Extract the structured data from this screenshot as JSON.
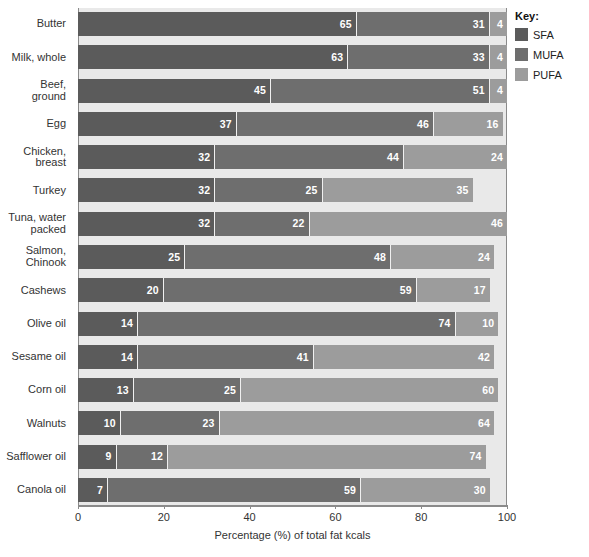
{
  "legend": {
    "title": "Key:",
    "items": [
      {
        "label": "SFA",
        "color": "#5b5b5b"
      },
      {
        "label": "MUFA",
        "color": "#6e6e6e"
      },
      {
        "label": "PUFA",
        "color": "#9c9c9c"
      }
    ]
  },
  "axis": {
    "x_title": "Percentage (%) of total fat kcals",
    "x_ticks": [
      "0",
      "20",
      "40",
      "60",
      "80",
      "100"
    ]
  },
  "chart_data": {
    "type": "bar",
    "orientation": "horizontal",
    "stacked": true,
    "title": "",
    "xlabel": "Percentage (%) of total fat kcals",
    "ylabel": "",
    "xlim": [
      0,
      100
    ],
    "xticks": [
      0,
      20,
      40,
      60,
      80,
      100
    ],
    "grid": false,
    "legend_position": "right",
    "legend_title": "Key:",
    "categories": [
      "Butter",
      "Milk, whole",
      "Beef,\nground",
      "Egg",
      "Chicken,\nbreast",
      "Turkey",
      "Tuna, water\npacked",
      "Salmon,\nChinook",
      "Cashews",
      "Olive oil",
      "Sesame oil",
      "Corn oil",
      "Walnuts",
      "Safflower oil",
      "Canola oil"
    ],
    "series": [
      {
        "name": "SFA",
        "color": "#5b5b5b",
        "values": [
          65,
          63,
          45,
          37,
          32,
          32,
          32,
          25,
          20,
          14,
          14,
          13,
          10,
          9,
          7
        ]
      },
      {
        "name": "MUFA",
        "color": "#6e6e6e",
        "values": [
          31,
          33,
          51,
          46,
          44,
          25,
          22,
          48,
          59,
          74,
          41,
          25,
          23,
          12,
          59
        ]
      },
      {
        "name": "PUFA",
        "color": "#9c9c9c",
        "values": [
          4,
          4,
          4,
          16,
          24,
          35,
          46,
          24,
          17,
          10,
          42,
          60,
          64,
          74,
          30
        ]
      }
    ]
  }
}
